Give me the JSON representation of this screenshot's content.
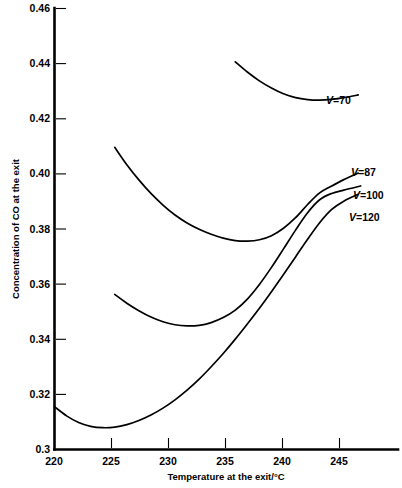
{
  "chart_data": {
    "type": "line",
    "title": "",
    "xlabel": "Temperature at the exit/°C",
    "ylabel": "Concentration of CO at the exit",
    "xlim": [
      220,
      248.5
    ],
    "ylim": [
      0.3,
      0.46
    ],
    "xticks": [
      220,
      225,
      230,
      235,
      240,
      245
    ],
    "xtick_labels": [
      "220",
      "225",
      "230",
      "235",
      "240",
      "245"
    ],
    "yticks": [
      0.3,
      0.32,
      0.34,
      0.36,
      0.38,
      0.4,
      0.42,
      0.44,
      0.46
    ],
    "ytick_labels": [
      "0.3",
      "0.32",
      "0.34",
      "0.36",
      "0.38",
      "0.40",
      "0.42",
      "0.44",
      "0.46"
    ],
    "grid": false,
    "legend_position": "right-inline",
    "series": [
      {
        "name": "V=70",
        "label_prefix": "V",
        "label_value": "=70",
        "x": [
          235.0,
          236.0,
          237.0,
          238.0,
          239.0,
          240.0,
          241.0,
          242.0,
          243.0,
          244.0,
          245.2
        ],
        "y": [
          0.4405,
          0.4368,
          0.4336,
          0.431,
          0.4289,
          0.4275,
          0.4268,
          0.4266,
          0.4269,
          0.4275,
          0.4285
        ]
      },
      {
        "name": "V=87",
        "label_prefix": "V",
        "label_value": "=87",
        "x": [
          225.0,
          226.0,
          227.0,
          228.0,
          229.0,
          230.0,
          231.0,
          232.0,
          233.0,
          234.0,
          235.0,
          236.0,
          237.0,
          238.0,
          239.0,
          240.0,
          241.0,
          242.0,
          243.0,
          244.0,
          245.2
        ],
        "y": [
          0.4095,
          0.4032,
          0.3977,
          0.3928,
          0.3886,
          0.385,
          0.3821,
          0.3798,
          0.378,
          0.3766,
          0.3757,
          0.3755,
          0.376,
          0.3775,
          0.3802,
          0.384,
          0.3888,
          0.393,
          0.3955,
          0.3978,
          0.4002
        ]
      },
      {
        "name": "V=100",
        "label_prefix": "V",
        "label_value": "=100",
        "x": [
          225.0,
          226.0,
          227.0,
          228.0,
          229.0,
          230.0,
          231.0,
          232.0,
          233.0,
          234.0,
          235.0,
          236.0,
          237.0,
          238.0,
          239.0,
          240.0,
          241.0,
          242.0,
          243.0,
          244.0,
          245.4
        ],
        "y": [
          0.3562,
          0.353,
          0.3503,
          0.348,
          0.3463,
          0.3452,
          0.3448,
          0.345,
          0.346,
          0.3478,
          0.3505,
          0.3545,
          0.3598,
          0.366,
          0.3727,
          0.3795,
          0.3858,
          0.3905,
          0.3928,
          0.394,
          0.3955
        ]
      },
      {
        "name": "V=120",
        "label_prefix": "V",
        "label_value": "=120",
        "x": [
          220.0,
          221.0,
          222.0,
          223.0,
          224.0,
          225.0,
          226.0,
          227.0,
          228.0,
          229.0,
          230.0,
          231.0,
          232.0,
          233.0,
          234.0,
          235.0,
          236.0,
          237.0,
          238.0,
          239.0,
          240.0,
          241.0,
          242.0,
          243.0,
          244.0,
          245.2
        ],
        "y": [
          0.3155,
          0.3122,
          0.3098,
          0.3084,
          0.3079,
          0.3081,
          0.309,
          0.3105,
          0.3125,
          0.315,
          0.318,
          0.3215,
          0.3255,
          0.33,
          0.3348,
          0.34,
          0.3455,
          0.3512,
          0.3572,
          0.3634,
          0.3698,
          0.3762,
          0.3822,
          0.387,
          0.39,
          0.3925
        ]
      }
    ]
  },
  "labels": {
    "v70": "V=70",
    "v87": "V=87",
    "v100": "V=100",
    "v120": "V=120",
    "v_italic": "V",
    "v70_rest": "=70",
    "v87_rest": "=87",
    "v100_rest": "=100",
    "v120_rest": "=120"
  },
  "colors": {
    "axis": "#000000",
    "curve": "#000000",
    "background": "#ffffff"
  }
}
